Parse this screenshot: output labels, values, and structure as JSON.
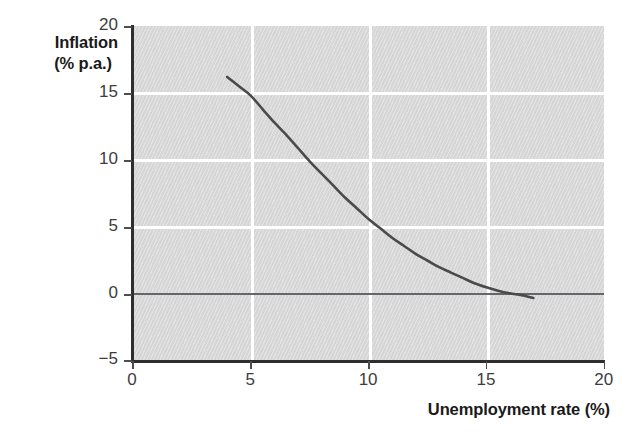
{
  "chart_data": {
    "type": "line",
    "title": "",
    "xlabel": "Unemployment rate (%)",
    "ylabel_line1": "Inflation",
    "ylabel_line2": "(% p.a.)",
    "ylabel": "Inflation (% p.a.)",
    "xlim": [
      0,
      20
    ],
    "ylim": [
      -5,
      20
    ],
    "xticks": [
      0,
      5,
      10,
      15,
      20
    ],
    "yticks": [
      -5,
      0,
      5,
      10,
      15,
      20
    ],
    "xtick_labels": [
      "0",
      "5",
      "10",
      "15",
      "20"
    ],
    "ytick_labels": [
      "−5",
      "0",
      "5",
      "10",
      "15",
      "20"
    ],
    "grid": true,
    "grid_color": "#ffffff",
    "plot_background": "#d6d6d6",
    "legend": "none",
    "zero_reference_line": {
      "value": 0,
      "color": "#63666b"
    },
    "series": [
      {
        "name": "Phillips curve",
        "color": "#4a4a4a",
        "linewidth": 2.6,
        "x": [
          4.0,
          4.5,
          5.0,
          5.5,
          6.0,
          6.5,
          7.0,
          7.5,
          8.0,
          8.5,
          9.0,
          9.5,
          10.0,
          10.5,
          11.0,
          11.5,
          12.0,
          12.5,
          13.0,
          13.5,
          14.0,
          14.5,
          15.0,
          15.5,
          16.0,
          16.5,
          17.0
        ],
        "y": [
          16.2,
          15.5,
          14.8,
          13.8,
          12.8,
          11.9,
          10.9,
          9.9,
          9.0,
          8.1,
          7.2,
          6.4,
          5.6,
          4.9,
          4.2,
          3.6,
          3.0,
          2.5,
          2.0,
          1.6,
          1.2,
          0.8,
          0.5,
          0.25,
          0.05,
          -0.1,
          -0.3
        ]
      }
    ]
  }
}
